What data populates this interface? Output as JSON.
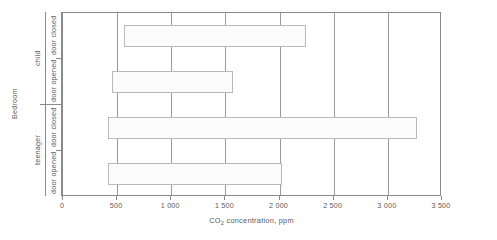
{
  "chart_data": {
    "type": "bar",
    "orientation": "horizontal",
    "title": "",
    "xlabel": "CO2 concentration, ppm",
    "xlabel_prefix": "CO",
    "xlabel_sub": "2",
    "xlabel_suffix": " concentration, ppm",
    "ylabel": "Bedroom",
    "xlim": [
      0,
      3500
    ],
    "xticks": [
      0,
      500,
      1000,
      1500,
      2000,
      2500,
      3000,
      3500
    ],
    "xticklabels": [
      "0",
      "500",
      "1 000",
      "1 500",
      "2 000",
      "2 500",
      "3 000",
      "3 500"
    ],
    "grid": "vertical",
    "legend": "none",
    "group_labels": [
      "child",
      "teenager"
    ],
    "categories": [
      "door closed",
      "door opened",
      "door closed",
      "door opened"
    ],
    "bars": [
      {
        "group": "child",
        "condition": "door closed",
        "low": 560,
        "high": 2240
      },
      {
        "group": "child",
        "condition": "door opened",
        "low": 450,
        "high": 1570
      },
      {
        "group": "teenager",
        "condition": "door closed",
        "low": 420,
        "high": 3270
      },
      {
        "group": "teenager",
        "condition": "door opened",
        "low": 420,
        "high": 2020
      }
    ],
    "bar_style": {
      "fill": "#fbfbfb",
      "edge": "#b9b9b9"
    },
    "axis_color": "#8a8a8a",
    "grid_color": "#9a9a9a",
    "text_color": "#5a5a5a"
  }
}
